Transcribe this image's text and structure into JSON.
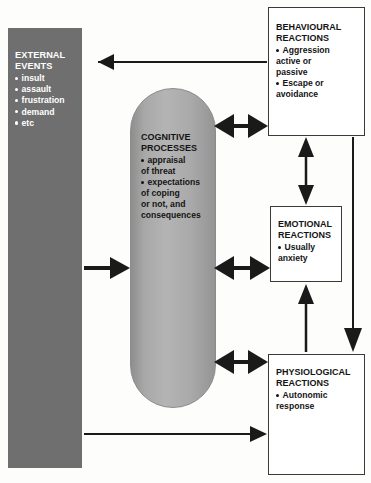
{
  "diagram": {
    "colors": {
      "external_block": "#6f6f6f",
      "capsule_gray": "#b4b4b4",
      "box_border": "#3a3a3a",
      "arrow": "#1a1a1a",
      "text_on_dark": "#ffffff",
      "text_on_light": "#141414"
    },
    "external_events": {
      "title_line1": "EXTERNAL",
      "title_line2": "EVENTS",
      "items": [
        "insult",
        "assault",
        "frustration",
        "demand",
        "etc"
      ]
    },
    "cognitive_processes": {
      "title_line1": "COGNITIVE",
      "title_line2": "PROCESSES",
      "items": [
        {
          "bullet": true,
          "text": "appraisal"
        },
        {
          "bullet": false,
          "text": "of threat"
        },
        {
          "bullet": true,
          "text": "expectations"
        },
        {
          "bullet": false,
          "text": "of coping"
        },
        {
          "bullet": false,
          "text": "or not, and"
        },
        {
          "bullet": false,
          "text": "consequences"
        }
      ]
    },
    "behavioural_reactions": {
      "title_line1": "BEHAVIOURAL",
      "title_line2": "REACTIONS",
      "items": [
        {
          "bullet": true,
          "text": "Aggression"
        },
        {
          "bullet": false,
          "text": "active or"
        },
        {
          "bullet": false,
          "text": "passive"
        },
        {
          "bullet": true,
          "text": "Escape or"
        },
        {
          "bullet": false,
          "text": "avoidance"
        }
      ]
    },
    "emotional_reactions": {
      "title_line1": "EMOTIONAL",
      "title_line2": "REACTIONS",
      "items": [
        {
          "bullet": true,
          "text": "Usually"
        },
        {
          "bullet": false,
          "text": "anxiety"
        }
      ]
    },
    "physiological_reactions": {
      "title_line1": "PHYSIOLOGICAL",
      "title_line2": "REACTIONS",
      "items": [
        {
          "bullet": true,
          "text": "Autonomic"
        },
        {
          "bullet": false,
          "text": "response"
        }
      ]
    },
    "connectors": [
      {
        "name": "behavioural-to-external",
        "direction": "left",
        "style": "thin"
      },
      {
        "name": "external-to-cognitive",
        "direction": "right",
        "style": "thick"
      },
      {
        "name": "external-to-physiological",
        "direction": "right",
        "style": "thin"
      },
      {
        "name": "cognitive-behavioural",
        "direction": "both",
        "style": "thick"
      },
      {
        "name": "cognitive-emotional",
        "direction": "both",
        "style": "thick"
      },
      {
        "name": "cognitive-physiological",
        "direction": "both",
        "style": "thick"
      },
      {
        "name": "behavioural-emotional",
        "direction": "both",
        "style": "thin"
      },
      {
        "name": "physiological-to-emotional",
        "direction": "up",
        "style": "thin"
      },
      {
        "name": "behavioural-to-physiological",
        "direction": "down",
        "style": "thin"
      }
    ]
  }
}
